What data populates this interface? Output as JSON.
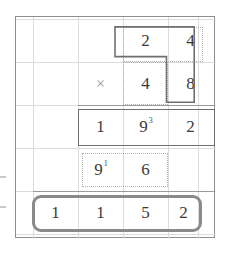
{
  "worksheet": {
    "kind": "long-multiplication-grid",
    "operator_symbol": "×",
    "columns": 4,
    "rows": 5,
    "rows_data": [
      {
        "name": "multiplicand-row",
        "cells": [
          "",
          "",
          "2",
          "4"
        ],
        "carries": [
          "",
          "",
          "",
          ""
        ]
      },
      {
        "name": "multiplier-row",
        "cells": [
          "",
          "×",
          "4",
          "8"
        ],
        "carries": [
          "",
          "",
          "",
          ""
        ]
      },
      {
        "name": "first-partial-product-row",
        "cells": [
          "",
          "1",
          "9",
          "2"
        ],
        "carries": [
          "",
          "",
          "3",
          ""
        ]
      },
      {
        "name": "second-partial-product-row",
        "cells": [
          "",
          "9",
          "6",
          ""
        ],
        "carries": [
          "",
          "1",
          "",
          ""
        ]
      },
      {
        "name": "final-answer-row",
        "cells": [
          "1",
          "1",
          "5",
          "2"
        ],
        "carries": [
          "",
          "",
          "",
          ""
        ]
      }
    ]
  },
  "colors": {
    "frame": "#8e8e8e",
    "gridline": "#dcdcdc",
    "digit": "#3a3a3a",
    "operator": "#9a9a9a",
    "dotted_box": "#b0b0b0",
    "solid_box": "#6f6f6f",
    "answer_box": "#8a8a8a",
    "rule": "#9a9a9a"
  }
}
